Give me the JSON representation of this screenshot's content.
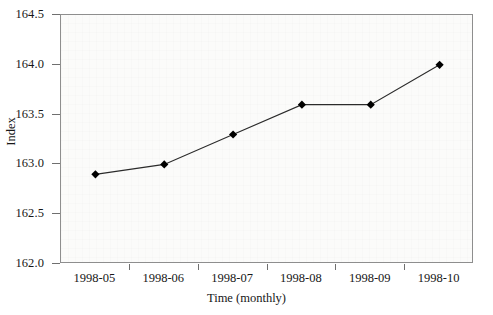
{
  "chart_data": {
    "type": "line",
    "title": "",
    "xlabel": "Time (monthly)",
    "ylabel": "Index",
    "categories": [
      "1998-05",
      "1998-06",
      "1998-07",
      "1998-08",
      "1998-09",
      "1998-10"
    ],
    "values": [
      162.9,
      163.0,
      163.3,
      163.6,
      163.6,
      164.0
    ],
    "series": [
      {
        "name": "Index",
        "values": [
          162.9,
          163.0,
          163.3,
          163.6,
          163.6,
          164.0
        ]
      }
    ],
    "ylim": [
      162.0,
      164.5
    ],
    "yticks": [
      162.0,
      162.5,
      163.0,
      163.5,
      164.0,
      164.5
    ],
    "ytick_labels": [
      "162.0",
      "162.5",
      "163.0",
      "163.5",
      "164.0",
      "164.5"
    ],
    "grid": false,
    "legend": false,
    "marker": "filled-diamond",
    "marker_color": "#000000",
    "line_color": "#2b2b2b",
    "plot_background": "#fbfbfa",
    "axis_color": "#8e8e8e"
  }
}
